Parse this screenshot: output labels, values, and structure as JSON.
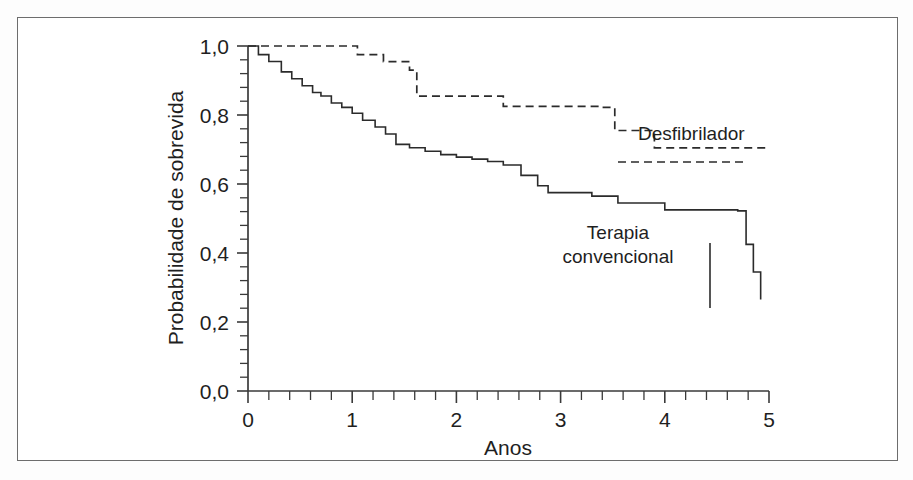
{
  "figure": {
    "background_color": "#ffffff",
    "frame_color": "#6d6d6d",
    "line_color": "#2b2b2b"
  },
  "axis": {
    "x_title": "Anos",
    "y_title": "Probabilidade de sobrevida",
    "x_ticks": [
      "0",
      "1",
      "2",
      "3",
      "4",
      "5"
    ],
    "y_ticks": [
      "0,0",
      "0,2",
      "0,4",
      "0,6",
      "0,8",
      "1,0"
    ]
  },
  "annotations": {
    "defibrillator": "Desfibrilador",
    "conventional_line1": "Terapia",
    "conventional_line2": "convencional"
  },
  "chart_data": {
    "type": "line",
    "title": "",
    "subtitle": "",
    "xlabel": "Anos",
    "ylabel": "Probabilidade de sobrevida",
    "xlim": [
      0,
      5
    ],
    "ylim": [
      0.0,
      1.0
    ],
    "xticks": [
      0,
      1,
      2,
      3,
      4,
      5
    ],
    "yticks": [
      0.0,
      0.2,
      0.4,
      0.6,
      0.8,
      1.0
    ],
    "xtick_labels": [
      "0",
      "1",
      "2",
      "3",
      "4",
      "5"
    ],
    "ytick_labels": [
      "0,0",
      "0,2",
      "0,4",
      "0,6",
      "0,8",
      "1,0"
    ],
    "grid": false,
    "legend": "inline-annotations",
    "step_type": "post",
    "series": [
      {
        "name": "Desfibrilador",
        "style": "dashed",
        "color": "#2b2b2b",
        "x": [
          0.0,
          0.55,
          1.05,
          1.3,
          1.55,
          1.62,
          2.35,
          2.45,
          3.4,
          3.52,
          3.9,
          5.0
        ],
        "y": [
          1.0,
          1.0,
          0.975,
          0.955,
          0.93,
          0.855,
          0.855,
          0.825,
          0.822,
          0.755,
          0.705,
          0.705
        ]
      },
      {
        "name": "Terapia convencional",
        "style": "solid",
        "color": "#2b2b2b",
        "x": [
          0.0,
          0.1,
          0.2,
          0.32,
          0.42,
          0.52,
          0.62,
          0.7,
          0.8,
          0.9,
          1.0,
          1.1,
          1.22,
          1.32,
          1.42,
          1.55,
          1.7,
          1.85,
          2.0,
          2.15,
          2.3,
          2.45,
          2.62,
          2.78,
          2.88,
          3.3,
          3.55,
          4.0,
          4.7,
          4.78,
          4.85,
          4.92
        ],
        "y": [
          1.0,
          0.975,
          0.955,
          0.925,
          0.905,
          0.885,
          0.865,
          0.855,
          0.835,
          0.822,
          0.805,
          0.785,
          0.765,
          0.745,
          0.715,
          0.705,
          0.695,
          0.685,
          0.678,
          0.672,
          0.665,
          0.655,
          0.625,
          0.595,
          0.575,
          0.565,
          0.545,
          0.525,
          0.522,
          0.425,
          0.345,
          0.265
        ]
      }
    ],
    "annotations": [
      {
        "text": "Desfibrilador",
        "x": 3.62,
        "y": 0.735
      },
      {
        "text": "Terapia convencional",
        "x": 3.25,
        "y": 0.445
      }
    ]
  }
}
